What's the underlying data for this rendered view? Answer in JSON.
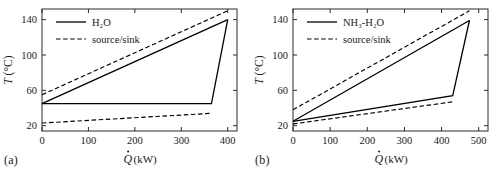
{
  "figure": {
    "panels": [
      {
        "tag": "(a)",
        "legend": [
          {
            "label": "H₂O",
            "style": "solid"
          },
          {
            "label": "source/sink",
            "style": "dashed"
          }
        ]
      },
      {
        "tag": "(b)",
        "legend": [
          {
            "label": "NH₃-H₂O",
            "style": "solid"
          },
          {
            "label": "source/sink",
            "style": "dashed"
          }
        ]
      }
    ]
  },
  "chart_data": [
    {
      "type": "line",
      "title": "",
      "panel": "(a)",
      "xlabel": "Q̇ (kW)",
      "ylabel": "T (°C)",
      "xlim": [
        0,
        420
      ],
      "ylim": [
        14,
        152
      ],
      "xticks": [
        0,
        100,
        200,
        300,
        400
      ],
      "yticks": [
        20,
        60,
        100,
        140
      ],
      "xticklabels": [
        "0",
        "100",
        "200",
        "300",
        "400"
      ],
      "yticklabels": [
        "20",
        "60",
        "100",
        "140"
      ],
      "grid": false,
      "legend_position": "upper-left",
      "series": [
        {
          "name": "H₂O source",
          "style": "dashed",
          "color": "#000000",
          "x": [
            0,
            400
          ],
          "y": [
            55,
            150
          ]
        },
        {
          "name": "H₂O working fluid (heat addition)",
          "style": "solid",
          "color": "#000000",
          "x": [
            0,
            400
          ],
          "y": [
            45,
            140
          ]
        },
        {
          "name": "H₂O working fluid (heat rejection)",
          "style": "solid",
          "color": "#000000",
          "x": [
            0,
            365,
            400
          ],
          "y": [
            45,
            45,
            140
          ]
        },
        {
          "name": "H₂O sink",
          "style": "dashed",
          "color": "#000000",
          "x": [
            0,
            365
          ],
          "y": [
            23,
            34
          ]
        }
      ]
    },
    {
      "type": "line",
      "title": "",
      "panel": "(b)",
      "xlabel": "Q̇ (kW)",
      "ylabel": "T (°C)",
      "xlim": [
        0,
        525
      ],
      "ylim": [
        14,
        152
      ],
      "xticks": [
        0,
        100,
        200,
        300,
        400,
        500
      ],
      "yticks": [
        20,
        60,
        100,
        140
      ],
      "xticklabels": [
        "0",
        "100",
        "200",
        "300",
        "400",
        "500"
      ],
      "yticklabels": [
        "20",
        "60",
        "100",
        "140"
      ],
      "grid": false,
      "legend_position": "upper-left",
      "series": [
        {
          "name": "NH₃-H₂O source",
          "style": "dashed",
          "color": "#000000",
          "x": [
            0,
            475
          ],
          "y": [
            38,
            150
          ]
        },
        {
          "name": "NH₃-H₂O working fluid (heat addition)",
          "style": "solid",
          "color": "#000000",
          "x": [
            0,
            475
          ],
          "y": [
            25,
            139
          ]
        },
        {
          "name": "NH₃-H₂O working fluid (heat rejection)",
          "style": "solid",
          "color": "#000000",
          "x": [
            0,
            430,
            475
          ],
          "y": [
            25,
            54,
            139
          ]
        },
        {
          "name": "NH₃-H₂O sink",
          "style": "dashed",
          "color": "#000000",
          "x": [
            0,
            430
          ],
          "y": [
            22,
            47
          ]
        }
      ]
    }
  ]
}
